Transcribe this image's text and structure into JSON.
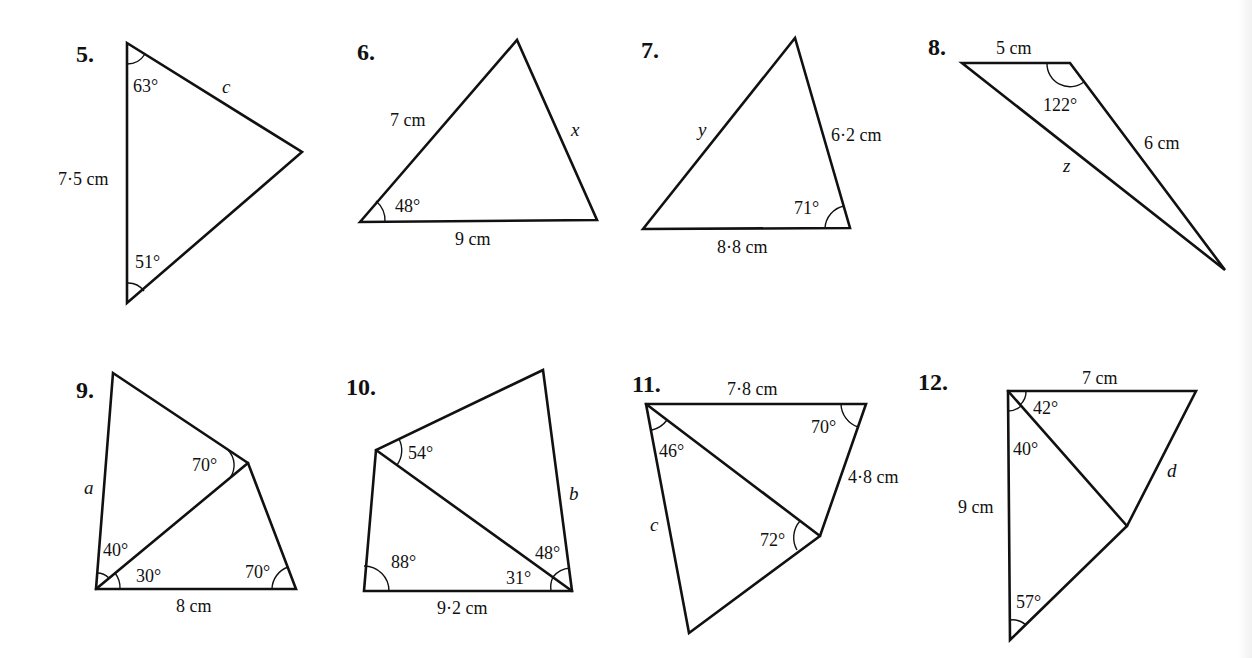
{
  "page": {
    "type": "textbook exercise diagrams — triangles and quadrilaterals (sine/cosine rule)",
    "background": "#ffffff",
    "ink_color": "#111111"
  },
  "problems": [
    {
      "number": "5.",
      "shape": "triangle",
      "labels": {
        "angle_top": "63°",
        "side_upper_right": "c",
        "side_left": "7·5 cm",
        "angle_bottom": "51°"
      }
    },
    {
      "number": "6.",
      "shape": "triangle",
      "labels": {
        "side_left": "7 cm",
        "side_right": "x",
        "angle_bottom_left": "48°",
        "side_bottom": "9 cm"
      }
    },
    {
      "number": "7.",
      "shape": "triangle",
      "labels": {
        "side_left": "y",
        "side_right": "6·2 cm",
        "angle_bottom_right": "71°",
        "side_bottom": "8·8 cm"
      }
    },
    {
      "number": "8.",
      "shape": "triangle",
      "labels": {
        "side_top": "5 cm",
        "angle_top_right": "122°",
        "side_right": "6 cm",
        "side_long": "z"
      }
    },
    {
      "number": "9.",
      "shape": "quadrilateral with diagonal",
      "labels": {
        "side_left": "a",
        "angle_upper": "70°",
        "angle_left_upper": "40°",
        "angle_left_lower": "30°",
        "angle_bottom_right": "70°",
        "side_bottom": "8 cm"
      }
    },
    {
      "number": "10.",
      "shape": "quadrilateral with diagonal",
      "labels": {
        "angle_left_top": "54°",
        "side_right": "b",
        "angle_bottom_left": "88°",
        "angle_right_upper": "48°",
        "angle_right_lower": "31°",
        "side_bottom": "9·2 cm"
      }
    },
    {
      "number": "11.",
      "shape": "quadrilateral with diagonal",
      "labels": {
        "side_top": "7·8 cm",
        "angle_top_right": "70°",
        "angle_top_left": "46°",
        "side_right": "4·8 cm",
        "side_left": "c",
        "angle_middle": "72°"
      }
    },
    {
      "number": "12.",
      "shape": "quadrilateral with diagonal",
      "labels": {
        "side_top": "7 cm",
        "angle_top_left_upper": "42°",
        "angle_top_left_lower": "40°",
        "side_right": "d",
        "side_left": "9 cm",
        "angle_bottom": "57°"
      }
    }
  ]
}
